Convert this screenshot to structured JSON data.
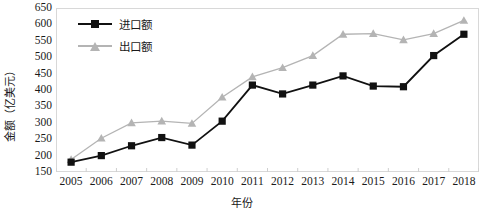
{
  "chart_data": {
    "type": "line",
    "title": "",
    "xlabel": "年份",
    "ylabel": "金额（亿美元）",
    "categories": [
      "2005",
      "2006",
      "2007",
      "2008",
      "2009",
      "2010",
      "2011",
      "2012",
      "2013",
      "2014",
      "2015",
      "2016",
      "2017",
      "2018"
    ],
    "ylim": [
      150,
      650
    ],
    "ytick_step": 50,
    "yticks": [
      "650",
      "600",
      "550",
      "500",
      "450",
      "400",
      "350",
      "300",
      "250",
      "200",
      "150"
    ],
    "grid": false,
    "legend_position": "top-left",
    "series": [
      {
        "name": "进口额",
        "marker": "square",
        "color": "#111111",
        "values": [
          180,
          200,
          230,
          255,
          232,
          305,
          415,
          388,
          415,
          443,
          412,
          410,
          505,
          570
        ]
      },
      {
        "name": "出口额",
        "marker": "triangle",
        "color": "#b4b4b4",
        "values": [
          188,
          253,
          300,
          305,
          298,
          378,
          440,
          468,
          505,
          570,
          572,
          553,
          572,
          612
        ]
      }
    ]
  },
  "legend": {
    "items": [
      {
        "label": "进口额",
        "marker": "square-marker-icon"
      },
      {
        "label": "出口额",
        "marker": "triangle-marker-icon"
      }
    ]
  },
  "axes": {
    "y_title": "金额（亿美元）",
    "x_title": "年份"
  }
}
